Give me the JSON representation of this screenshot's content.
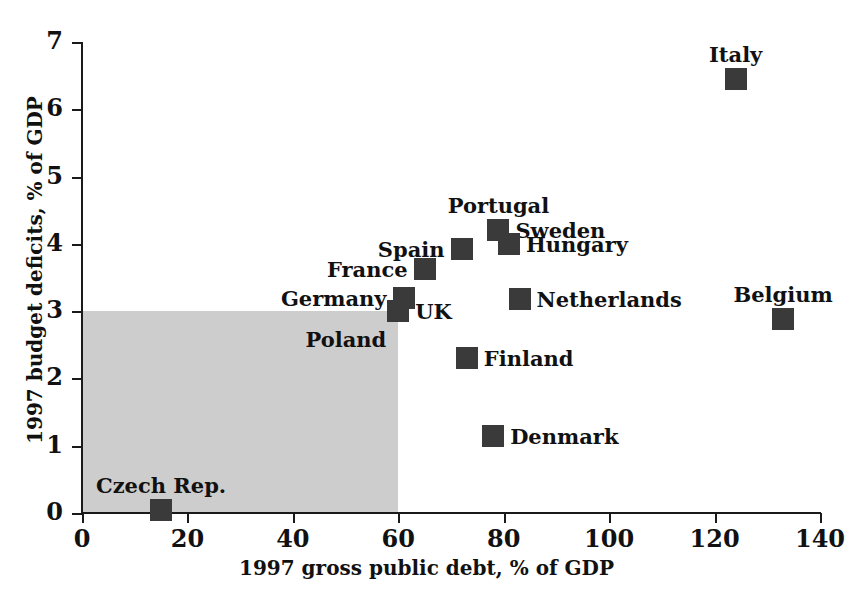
{
  "chart_data": {
    "type": "scatter",
    "title": "",
    "xlabel": "1997 gross public debt, % of GDP",
    "ylabel": "1997 budget deficits, % of GDP",
    "xlim": [
      0,
      140
    ],
    "ylim": [
      0,
      7
    ],
    "xticks": [
      0,
      20,
      40,
      60,
      80,
      100,
      120,
      140
    ],
    "yticks": [
      0,
      1,
      2,
      3,
      4,
      5,
      6,
      7
    ],
    "xticklabels": [
      "0",
      "20",
      "40",
      "60",
      "80",
      "100",
      "120",
      "140"
    ],
    "yticklabels": [
      "0",
      "1",
      "2",
      "3",
      "4",
      "5",
      "6",
      "7"
    ],
    "grid": false,
    "legend": false,
    "marker_color": "#3a3a3a",
    "marker_shape": "square",
    "shaded_region": {
      "name": "maastricht-criteria-region",
      "x_range": [
        0,
        60
      ],
      "y_range": [
        0,
        3
      ],
      "color": "#cdcdcd"
    },
    "points": [
      {
        "label": "Italy",
        "x": 124,
        "y": 6.45,
        "label_pos": "above"
      },
      {
        "label": "Portugal",
        "x": 79,
        "y": 4.2,
        "label_pos": "above"
      },
      {
        "label": "Sweden",
        "x": 79,
        "y": 4.2,
        "label_pos": "right"
      },
      {
        "label": "Hungary",
        "x": 81,
        "y": 4.0,
        "label_pos": "right"
      },
      {
        "label": "Spain",
        "x": 72,
        "y": 3.93,
        "label_pos": "left"
      },
      {
        "label": "France",
        "x": 65,
        "y": 3.63,
        "label_pos": "left"
      },
      {
        "label": "Germany",
        "x": 61,
        "y": 3.2,
        "label_pos": "left"
      },
      {
        "label": "UK",
        "x": 60,
        "y": 3.0,
        "label_pos": "right"
      },
      {
        "label": "Poland",
        "x": 60,
        "y": 3.0,
        "label_pos": "below-left"
      },
      {
        "label": "Netherlands",
        "x": 83,
        "y": 3.18,
        "label_pos": "right"
      },
      {
        "label": "Belgium",
        "x": 133,
        "y": 2.88,
        "label_pos": "above"
      },
      {
        "label": "Finland",
        "x": 73,
        "y": 2.3,
        "label_pos": "right"
      },
      {
        "label": "Denmark",
        "x": 78,
        "y": 1.15,
        "label_pos": "right"
      },
      {
        "label": "Czech Rep.",
        "x": 15,
        "y": 0.05,
        "label_pos": "above"
      }
    ]
  },
  "axis": {
    "x_title": "1997 gross public debt, % of GDP",
    "y_title": "1997 budget deficits, % of GDP"
  },
  "xtick_labels": [
    "0",
    "20",
    "40",
    "60",
    "80",
    "100",
    "120",
    "140"
  ],
  "ytick_labels": [
    "0",
    "1",
    "2",
    "3",
    "4",
    "5",
    "6",
    "7"
  ],
  "labels": {
    "italy": "Italy",
    "portugal": "Portugal",
    "sweden": "Sweden",
    "hungary": "Hungary",
    "spain": "Spain",
    "france": "France",
    "germany": "Germany",
    "uk": "UK",
    "poland": "Poland",
    "netherlands": "Netherlands",
    "belgium": "Belgium",
    "finland": "Finland",
    "denmark": "Denmark",
    "czech": "Czech Rep."
  }
}
